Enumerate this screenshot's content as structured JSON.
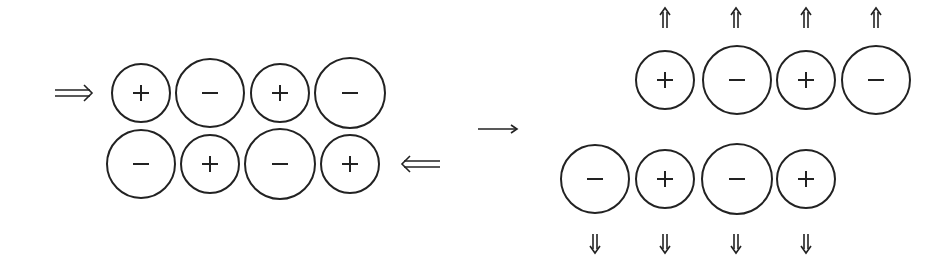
{
  "diagram": {
    "left_panel": {
      "top_row": [
        "+",
        "−",
        "+",
        "−"
      ],
      "bottom_row": [
        "−",
        "+",
        "−",
        "+"
      ],
      "force_arrows": [
        {
          "direction": "right",
          "row": "top"
        },
        {
          "direction": "left",
          "row": "bottom"
        }
      ]
    },
    "transition_arrow": "→",
    "right_panel": {
      "top_row": [
        "+",
        "−",
        "+",
        "−"
      ],
      "bottom_row": [
        "−",
        "+",
        "−",
        "+"
      ],
      "top_arrows": "up",
      "bottom_arrows": "down"
    }
  }
}
